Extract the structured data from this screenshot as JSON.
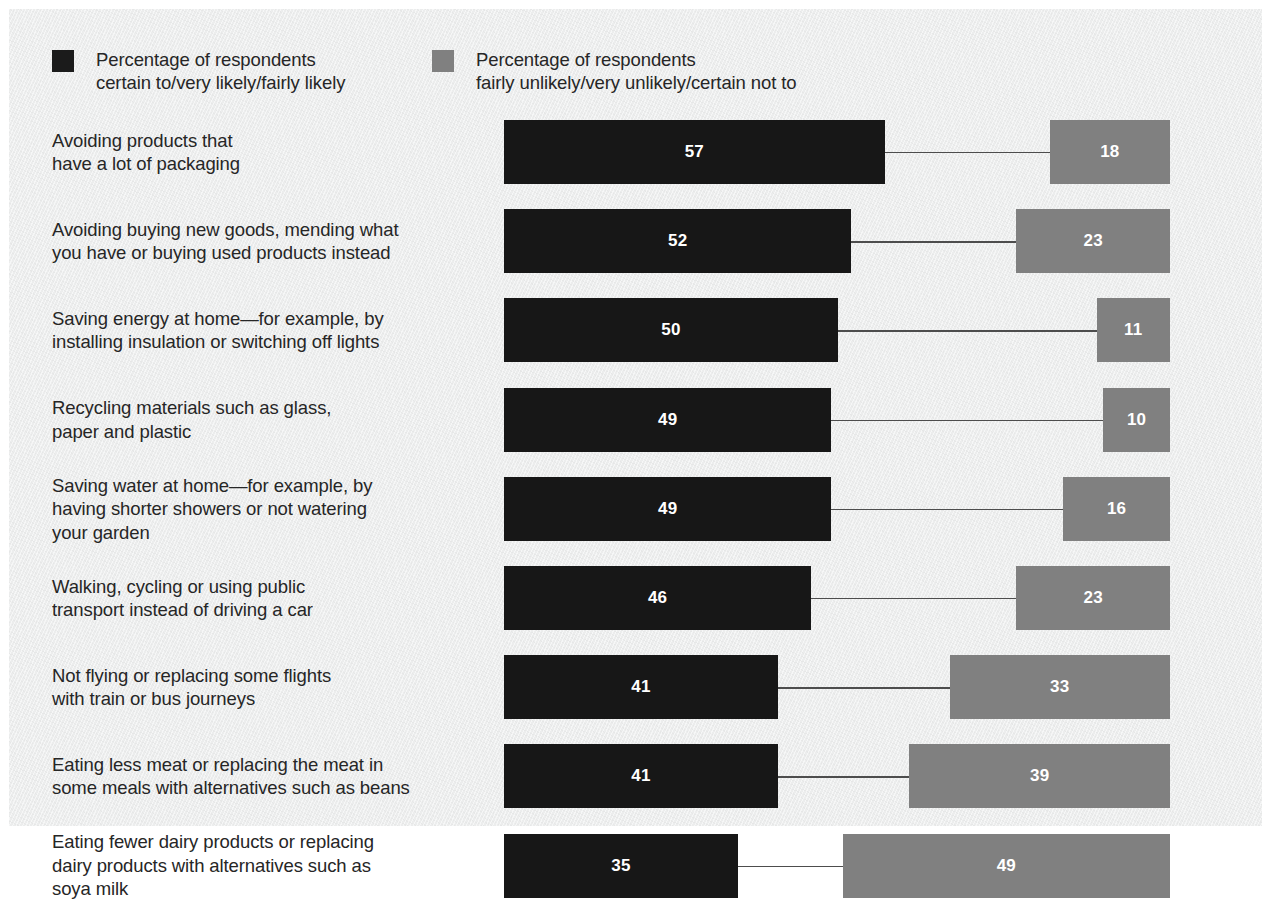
{
  "legend": {
    "items": [
      {
        "swatch": "dark-swatch",
        "color": "#1b1b1b",
        "label": "Percentage of respondents\ncertain to/very likely/fairly likely"
      },
      {
        "swatch": "gray-swatch",
        "color": "#808080",
        "label": "Percentage of respondents\nfairly unlikely/very unlikely/certain not to"
      }
    ]
  },
  "chart_data": {
    "type": "bar",
    "title": "",
    "subtitle": "",
    "xlabel": "",
    "ylabel": "",
    "orientation": "horizontal",
    "grid": false,
    "legend_position": "top-left",
    "axis_visible": false,
    "tick_labels": [],
    "value_unit": "percent",
    "xlim": [
      0,
      100
    ],
    "categories": [
      "Avoiding products that\nhave a lot of packaging",
      "Avoiding buying new goods, mending what\nyou have or buying used products instead",
      "Saving energy at home—for example, by\ninstalling insulation or switching off lights",
      "Recycling materials such as glass,\npaper and plastic",
      "Saving water at home—for example, by\nhaving shorter showers or not watering\nyour garden",
      "Walking, cycling or using public\ntransport instead of driving a car",
      "Not flying or replacing some flights\nwith train or bus journeys",
      "Eating less meat or replacing the meat in\nsome meals with alternatives such as beans",
      "Eating fewer dairy products or replacing\ndairy products with alternatives such as\nsoya milk"
    ],
    "series": [
      {
        "name": "Percentage of respondents certain to/very likely/fairly likely",
        "color": "#171717",
        "align": "left",
        "values": [
          57,
          52,
          50,
          49,
          49,
          46,
          41,
          41,
          35
        ]
      },
      {
        "name": "Percentage of respondents fairly unlikely/very unlikely/certain not to",
        "color": "#808080",
        "align": "right",
        "values": [
          18,
          23,
          11,
          10,
          16,
          23,
          33,
          39,
          49
        ]
      }
    ]
  }
}
